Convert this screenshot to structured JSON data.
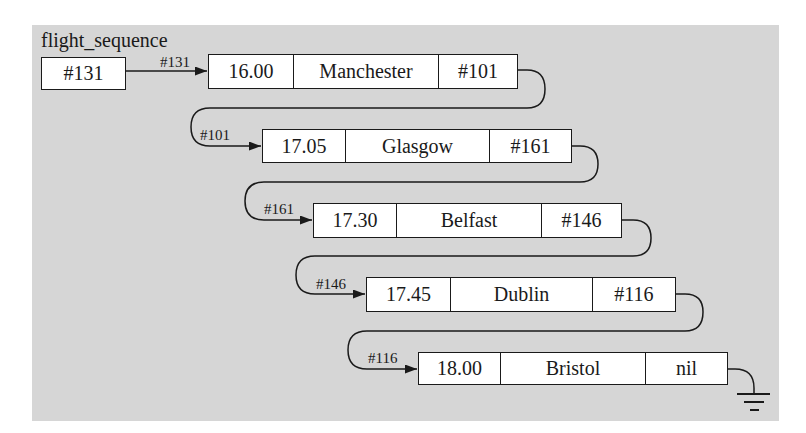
{
  "diagram": {
    "title": "flight_sequence",
    "head_pointer": "#131",
    "head_arrow_label": "#131",
    "nodes": [
      {
        "address": "#131",
        "time": "16.00",
        "city": "Manchester",
        "next": "#101"
      },
      {
        "address": "#101",
        "time": "17.05",
        "city": "Glasgow",
        "next": "#161"
      },
      {
        "address": "#161",
        "time": "17.30",
        "city": "Belfast",
        "next": "#146"
      },
      {
        "address": "#146",
        "time": "17.45",
        "city": "Dublin",
        "next": "#116"
      },
      {
        "address": "#116",
        "time": "18.00",
        "city": "Bristol",
        "next": "nil"
      }
    ],
    "terminator": "ground-symbol",
    "colors": {
      "panel": "#d6d6d6",
      "box": "#ffffff",
      "ink": "#1a1a1a"
    }
  }
}
